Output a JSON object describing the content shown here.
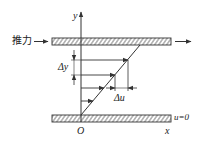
{
  "diagram": {
    "title": "",
    "labels": {
      "thrust": "推力",
      "y_axis": "y",
      "x_axis": "x",
      "origin": "O",
      "delta_y": "Δy",
      "delta_u": "Δu",
      "bottom_condition": "u=0"
    },
    "colors": {
      "stroke": "#333333",
      "background": "#ffffff"
    },
    "plates": [
      {
        "name": "top-moving-plate",
        "x": 52,
        "y": 38,
        "width": 119,
        "height": 7
      },
      {
        "name": "bottom-fixed-plate",
        "x": 52,
        "y": 115,
        "width": 119,
        "height": 7
      }
    ],
    "velocity_arrows_y": [
      60,
      75,
      87,
      100
    ]
  }
}
